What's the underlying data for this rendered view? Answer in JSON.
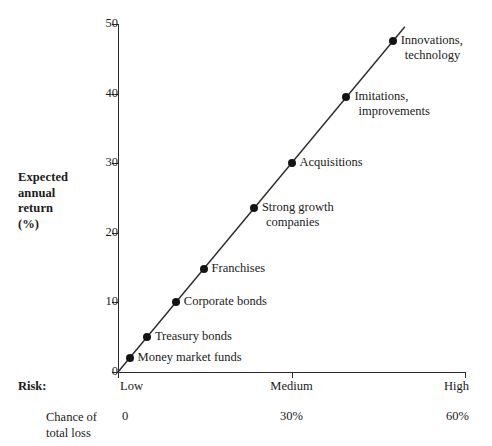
{
  "chart_data": {
    "type": "scatter",
    "title": "",
    "subtitle": "",
    "xlabel": "Risk:",
    "ylabel": "Expected annual return (%)",
    "ylabel_lines": [
      "Expected",
      "annual",
      "return",
      "(%)"
    ],
    "ylim": [
      0,
      50
    ],
    "yticks": [
      0,
      10,
      20,
      30,
      40,
      50
    ],
    "ytick_labels": [
      "0",
      "10",
      "20",
      "30",
      "40",
      "50"
    ],
    "xlim": [
      0,
      60
    ],
    "xticks": [
      0,
      30,
      60
    ],
    "xtick_category_labels": [
      "Low",
      "Medium",
      "High"
    ],
    "secondary_axis_label_lines": [
      "Chance of",
      "total loss"
    ],
    "secondary_axis_values": [
      "0",
      "30%",
      "60%"
    ],
    "grid": false,
    "legend": false,
    "has_trend_line": true,
    "trend_line_from": {
      "x": 0,
      "y": 0
    },
    "trend_line_to": {
      "x": 49.6,
      "y": 49.6
    },
    "points": [
      {
        "label": "Money market funds",
        "x": 2.0,
        "y": 2.0,
        "label_position": "right"
      },
      {
        "label": "Treasury bonds",
        "x": 5.0,
        "y": 5.0,
        "label_position": "right"
      },
      {
        "label": "Corporate bonds",
        "x": 10.0,
        "y": 10.0,
        "label_position": "right"
      },
      {
        "label": "Franchises",
        "x": 14.8,
        "y": 14.8,
        "label_position": "right"
      },
      {
        "label": "Strong growth companies",
        "x": 23.5,
        "y": 23.5,
        "label_position": "right",
        "label_lines": [
          "Strong growth",
          "companies"
        ]
      },
      {
        "label": "Acquisitions",
        "x": 30.0,
        "y": 30.0,
        "label_position": "right"
      },
      {
        "label": "Imitations, improvements",
        "x": 39.5,
        "y": 39.5,
        "label_position": "right",
        "label_lines": [
          "Imitations,",
          "improvements"
        ]
      },
      {
        "label": "Innovations, technology",
        "x": 47.5,
        "y": 47.5,
        "label_position": "right",
        "label_lines": [
          "Innovations,",
          "technology"
        ]
      }
    ],
    "colors": {
      "marker": "#141414",
      "line": "#2a2a2a",
      "axis": "#2a2a2a",
      "text": "#1a1a1a",
      "background": "#ffffff"
    }
  }
}
